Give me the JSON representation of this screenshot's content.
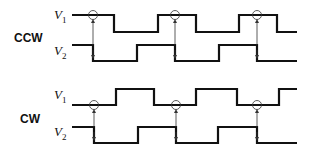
{
  "panels": [
    {
      "direction": "CCW",
      "signals": [
        {
          "name": "V",
          "sub": "1"
        },
        {
          "name": "V",
          "sub": "2"
        }
      ]
    },
    {
      "direction": "CW",
      "signals": [
        {
          "name": "V",
          "sub": "1"
        },
        {
          "name": "V",
          "sub": "2"
        }
      ]
    }
  ],
  "colors": {
    "line": "#111111",
    "arrow": "#333333"
  }
}
